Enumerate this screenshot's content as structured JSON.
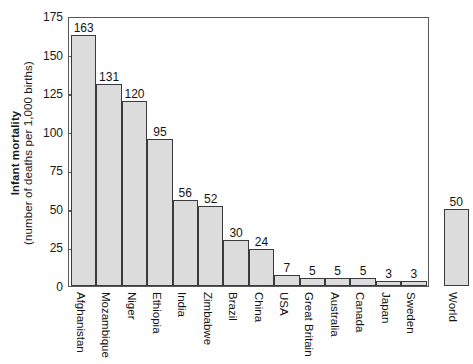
{
  "chart_data": {
    "type": "bar",
    "title": "",
    "subtitle": "",
    "xlabel": "",
    "ylabel_bold": "Infant mortality",
    "ylabel_sub": "(number of deaths per 1,000 births)",
    "ylim": [
      0,
      175
    ],
    "yticks": [
      0,
      25,
      50,
      75,
      100,
      125,
      150,
      175
    ],
    "ytick_labels": [
      "0",
      "25",
      "50",
      "75",
      "100",
      "125",
      "150",
      "175"
    ],
    "grid": false,
    "legend": null,
    "bar_fill_color": "#dcdcdc",
    "bar_edge_color": "#3a3a3c",
    "axis_color": "#58585a",
    "categories": [
      "Afghanistan",
      "Mozambique",
      "Niger",
      "Ethiopia",
      "India",
      "Zimbabwe",
      "Brazil",
      "China",
      "USA",
      "Great Britain",
      "Australia",
      "Canada",
      "Japan",
      "Sweden",
      "World"
    ],
    "values": [
      163,
      131,
      120,
      95,
      56,
      52,
      30,
      24,
      7,
      5,
      5,
      5,
      3,
      3,
      50
    ],
    "value_labels": [
      "163",
      "131",
      "120",
      "95",
      "56",
      "52",
      "30",
      "24",
      "7",
      "5",
      "5",
      "5",
      "3",
      "3",
      "50"
    ]
  }
}
